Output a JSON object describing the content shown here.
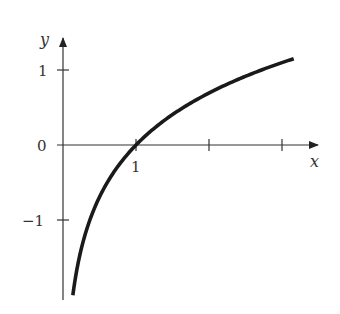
{
  "chart_data": {
    "type": "line",
    "title": "",
    "function": "y = ln(x)",
    "xlabel": "x",
    "ylabel": "y",
    "x_ticks": [
      1,
      2,
      3
    ],
    "x_tick_labels": [
      "1",
      "",
      ""
    ],
    "y_ticks": [
      -1,
      0,
      1
    ],
    "y_tick_labels": [
      "−1",
      "0",
      "1"
    ],
    "xlim": [
      -0.05,
      3.5
    ],
    "ylim": [
      -2.0,
      1.4
    ],
    "grid": false,
    "series": [
      {
        "name": "ln(x)",
        "x": [
          0.135,
          0.2,
          0.3,
          0.4,
          0.5,
          0.6,
          0.7,
          0.8,
          0.9,
          1.0,
          1.25,
          1.5,
          1.75,
          2.0,
          2.25,
          2.5,
          2.75,
          3.0,
          3.16
        ],
        "values": [
          -2.0,
          -1.61,
          -1.2,
          -0.92,
          -0.69,
          -0.51,
          -0.36,
          -0.22,
          -0.11,
          0.0,
          0.22,
          0.41,
          0.56,
          0.69,
          0.81,
          0.92,
          1.01,
          1.1,
          1.15
        ]
      }
    ],
    "color": "#1a1a1a"
  },
  "labels": {
    "x_axis": "x",
    "y_axis": "y",
    "y_tick_pos": "1",
    "y_tick_zero": "0",
    "y_tick_neg": "−1",
    "x_tick_one": "1"
  }
}
